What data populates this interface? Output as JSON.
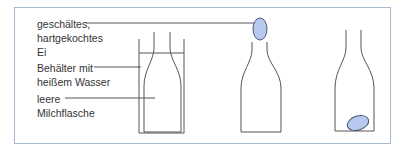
{
  "labels": {
    "egg_line1": "geschältes,",
    "egg_line2": "hartgekochtes",
    "egg_line3": "Ei",
    "container_line1": "Behälter mit",
    "container_line2": "heißem Wasser",
    "bottle_line1": "leere",
    "bottle_line2": "Milchflasche"
  },
  "colors": {
    "frame": "#a9b8d3",
    "line": "#555555",
    "egg_fill": "#b7c9ee",
    "egg_stroke": "#4a5878",
    "text": "#333333"
  }
}
